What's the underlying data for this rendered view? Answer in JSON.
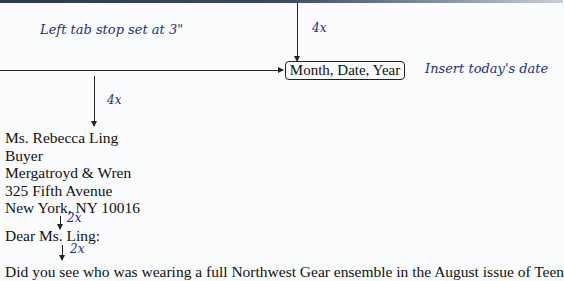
{
  "annotations": {
    "top_spacing": "4x",
    "tab_stop": "Left tab stop set at 3\"",
    "date_instruction": "Insert today's date",
    "after_date_spacing": "4x",
    "after_address_spacing": "2x",
    "after_salutation_spacing": "2x"
  },
  "date_placeholder": "Month, Date, Year",
  "inside_address": [
    "Ms. Rebecca Ling",
    "Buyer",
    "Mergatroyd & Wren",
    "325 Fifth Avenue",
    "New York, NY 10016"
  ],
  "salutation": "Dear Ms. Ling:",
  "body_first_line": "Did you see who was wearing a full Northwest Gear ensemble in the August issue of Teen",
  "colors": {
    "annotation": "#1f2f7a",
    "text": "#111111",
    "top_bar": "#2b3a55"
  }
}
